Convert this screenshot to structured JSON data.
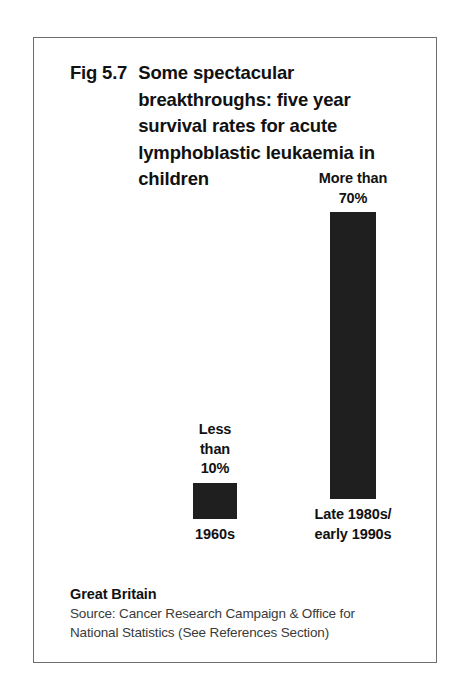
{
  "figure": {
    "number": "Fig 5.7",
    "title": "Some spectacular breakthroughs:  five year survival rates for acute lymphoblastic leukaemia in children",
    "region": "Great Britain",
    "source_line_1": "Source: Cancer Research Campaign & Office for",
    "source_line_2": "National Statistics (See References Section)"
  },
  "chart_data": {
    "type": "bar",
    "title": "Fig 5.7 Some spectacular breakthroughs:  five year survival rates for acute lymphoblastic leukaemia in children",
    "xlabel": "",
    "ylabel": "Five year survival rate (%)",
    "ylim": [
      0,
      80
    ],
    "grid": false,
    "legend": "none",
    "categories": [
      "1960s",
      "Late 1980s/\nearly 1990s"
    ],
    "values": [
      10,
      70
    ],
    "value_labels": [
      "Less\nthan\n10%",
      "More than\n70%"
    ],
    "annotations": [
      "Great Britain",
      "Source: Cancer Research Campaign & Office for National Statistics (See References Section)"
    ],
    "bar_color": "#1f1f1f",
    "background_color": "#ffffff"
  }
}
